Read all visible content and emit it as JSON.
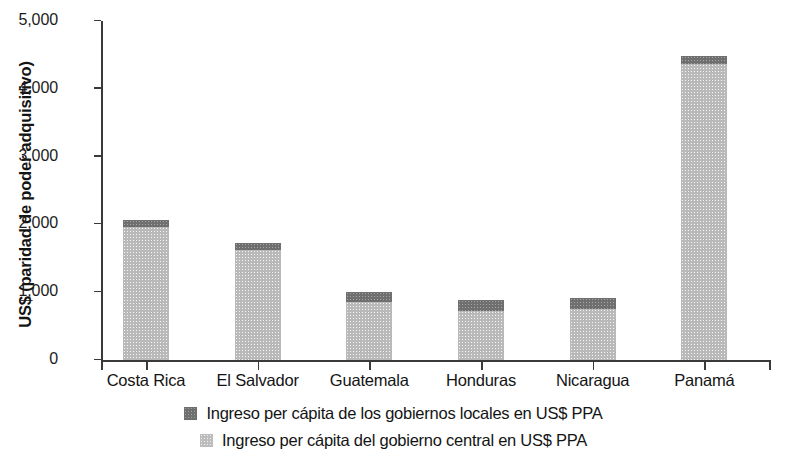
{
  "chart_data": {
    "type": "bar",
    "stacked": true,
    "title": "",
    "xlabel": "",
    "ylabel": "US$ (paridad de poder adquisitivo)",
    "ylim": [
      0,
      5000
    ],
    "ytick_values": [
      0,
      1000,
      2000,
      3000,
      4000,
      5000
    ],
    "ytick_labels": [
      "0",
      "1,000",
      "2,000",
      "3,000",
      "4,000",
      "5,000"
    ],
    "grid": false,
    "legend_position": "bottom",
    "categories": [
      "Costa Rica",
      "El Salvador",
      "Guatemala",
      "Honduras",
      "Nicaragua",
      "Panamá"
    ],
    "series": [
      {
        "name": "Ingreso per cápita del gobierno central en US$ PPA",
        "color": "#b9b9b9",
        "values": [
          1960,
          1630,
          860,
          730,
          750,
          4370
        ]
      },
      {
        "name": "Ingreso per cápita de los gobiernos locales en US$ PPA",
        "color": "#6f6f6f",
        "values": [
          110,
          100,
          150,
          150,
          170,
          110
        ]
      }
    ],
    "totals": [
      2070,
      1730,
      1010,
      880,
      920,
      4480
    ]
  },
  "legend": {
    "items": [
      {
        "label": "Ingreso per cápita de los gobiernos locales en US$ PPA",
        "swatch": "dark"
      },
      {
        "label": "Ingreso per cápita del gobierno central en US$ PPA",
        "swatch": "light"
      }
    ]
  }
}
